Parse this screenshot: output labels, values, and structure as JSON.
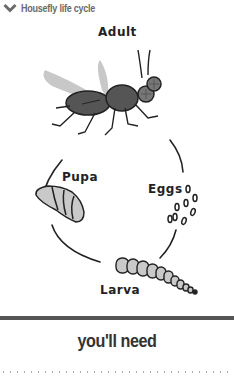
{
  "section": {
    "title": "Housefly life cycle",
    "expanded": true,
    "icon": "chevron-down-icon"
  },
  "diagram": {
    "stages": {
      "adult": "Adult",
      "eggs": "Eggs",
      "larva": "Larva",
      "pupa": "Pupa"
    }
  },
  "next_section": {
    "heading": "you'll need"
  },
  "colors": {
    "header_text": "#6a6a6a",
    "fly_body": "#555555",
    "wing": "#c8c8c8",
    "larva_pupa_fill": "#c9c9c9",
    "rule": "#555555"
  }
}
